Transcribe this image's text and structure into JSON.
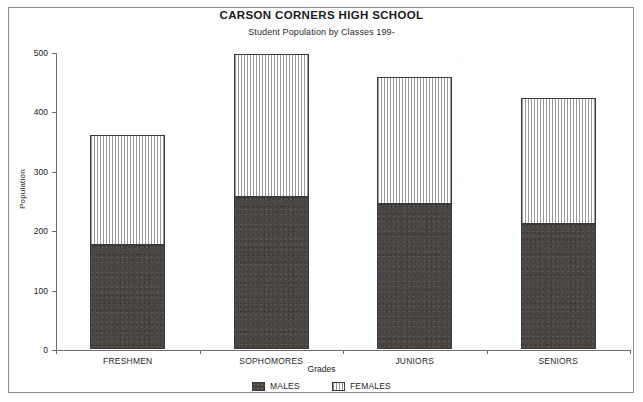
{
  "chart_data": {
    "type": "bar",
    "stacked": true,
    "title": "CARSON CORNERS HIGH SCHOOL",
    "subtitle": "Student Population by Classes 199-",
    "xlabel": "Grades",
    "ylabel": "Population",
    "categories": [
      "FRESHMEN",
      "SOPHOMORES",
      "JUNIORS",
      "SENIORS"
    ],
    "series": [
      {
        "name": "MALES",
        "values": [
          175,
          256,
          244,
          210
        ],
        "fill": "solid-dark",
        "color": "#4b4642"
      },
      {
        "name": "FEMALES",
        "values": [
          185,
          241,
          214,
          212
        ],
        "fill": "vertical-stripes",
        "color": "#ffffff"
      }
    ],
    "totals": [
      360,
      497,
      458,
      422
    ],
    "ylim": [
      0,
      500
    ],
    "yticks": [
      0,
      100,
      200,
      300,
      400,
      500
    ],
    "ytick_labels": [
      "0",
      "100",
      "200",
      "300",
      "400",
      "500"
    ],
    "grid": false,
    "legend_position": "bottom-center"
  },
  "legend": {
    "items": [
      {
        "label": "MALES"
      },
      {
        "label": "FEMALES"
      }
    ]
  }
}
